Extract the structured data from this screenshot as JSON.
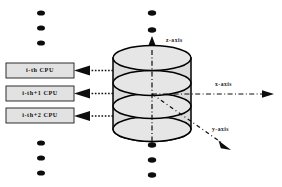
{
  "figure": {
    "background_color": "#ffffff",
    "ink_color": "#0d0d0d",
    "box_fill_color": "#e2e2e2",
    "disc_fill_color": "#e0e0e0"
  },
  "cpu_boxes": [
    {
      "label": "i-th CPU"
    },
    {
      "label": "i-th+1 CPU"
    },
    {
      "label": "i-th+2 CPU"
    }
  ],
  "axes": [
    {
      "name": "z-axis",
      "label": "z-axis"
    },
    {
      "name": "x-axis",
      "label": "x-axis"
    },
    {
      "name": "y-axis",
      "label": "y-axis"
    }
  ],
  "ellipsis_columns": [
    {
      "name": "left-top",
      "dots": 3
    },
    {
      "name": "left-bottom",
      "dots": 3
    },
    {
      "name": "center-top",
      "dots": 2
    },
    {
      "name": "center-bottom",
      "dots": 3
    }
  ],
  "cylinder": {
    "disc_count": 4,
    "description": "stacked cylindrical ring layers"
  }
}
